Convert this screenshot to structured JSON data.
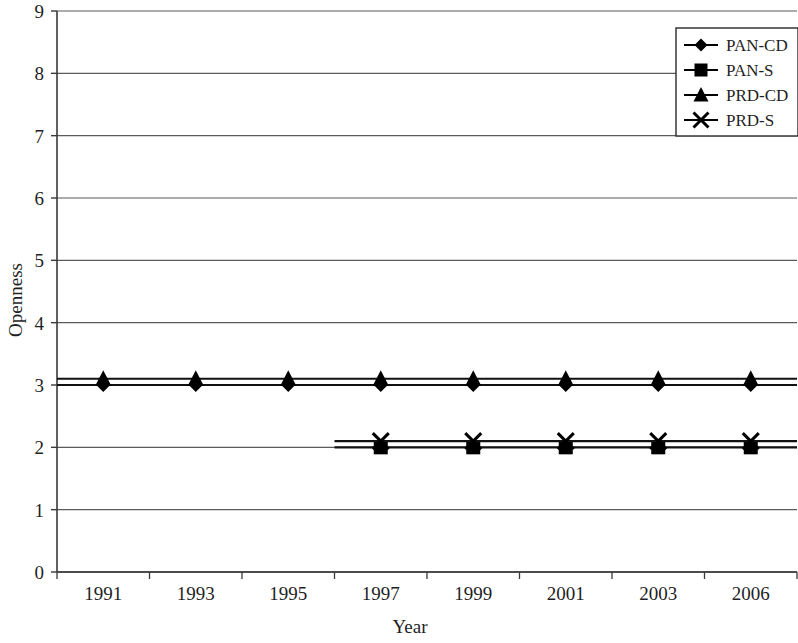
{
  "chart_data": {
    "type": "line",
    "title": "",
    "xlabel": "Year",
    "ylabel": "Openness",
    "categories": [
      "1991",
      "1993",
      "1995",
      "1997",
      "1999",
      "2001",
      "2003",
      "2006"
    ],
    "ylim": [
      0,
      9
    ],
    "yticks": [
      0,
      1,
      2,
      3,
      4,
      5,
      6,
      7,
      8,
      9
    ],
    "grid": "horizontal",
    "legend_position": "top-right",
    "series": [
      {
        "name": "PAN-CD",
        "marker": "diamond",
        "color": "#000000",
        "values": [
          3.0,
          3.0,
          3.0,
          3.0,
          3.0,
          3.0,
          3.0,
          3.0
        ]
      },
      {
        "name": "PAN-S",
        "marker": "square",
        "color": "#000000",
        "values": [
          null,
          null,
          null,
          2.0,
          2.0,
          2.0,
          2.0,
          2.0
        ]
      },
      {
        "name": "PRD-CD",
        "marker": "triangle",
        "color": "#000000",
        "values": [
          3.1,
          3.1,
          3.1,
          3.1,
          3.1,
          3.1,
          3.1,
          3.1
        ]
      },
      {
        "name": "PRD-S",
        "marker": "cross",
        "color": "#000000",
        "values": [
          null,
          null,
          null,
          2.1,
          2.1,
          2.1,
          2.1,
          2.1
        ]
      }
    ]
  },
  "axes": {
    "y_title": "Openness",
    "x_title": "Year",
    "y_tick_labels": [
      "9",
      "8",
      "7",
      "6",
      "5",
      "4",
      "3",
      "2",
      "1",
      "0"
    ],
    "x_tick_labels": [
      "1991",
      "1993",
      "1995",
      "1997",
      "1999",
      "2001",
      "2003",
      "2006"
    ]
  },
  "legend": {
    "entries": [
      {
        "label": "PAN-CD",
        "marker": "diamond"
      },
      {
        "label": "PAN-S",
        "marker": "square"
      },
      {
        "label": "PRD-CD",
        "marker": "triangle"
      },
      {
        "label": "PRD-S",
        "marker": "cross"
      }
    ]
  },
  "colors": {
    "line": "#111111",
    "grid": "#5a5a5a",
    "axis": "#3a3a3a",
    "text": "#1f1f1f",
    "background": "#ffffff"
  }
}
